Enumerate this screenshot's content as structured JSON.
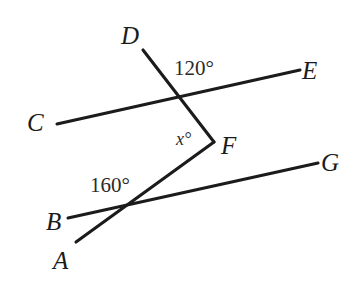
{
  "figure": {
    "type": "geometry-diagram",
    "background_color": "#ffffff",
    "stroke_color": "#1b1b1b",
    "text_color": "#1b1b1b",
    "width": 364,
    "height": 289
  },
  "points": [
    {
      "id": "A",
      "label": "A",
      "x": 53,
      "y": 248
    },
    {
      "id": "B",
      "label": "B",
      "x": 46,
      "y": 209
    },
    {
      "id": "C",
      "label": "C",
      "x": 27,
      "y": 110
    },
    {
      "id": "D",
      "label": "D",
      "x": 121,
      "y": 23
    },
    {
      "id": "E",
      "label": "E",
      "x": 302,
      "y": 58
    },
    {
      "id": "F",
      "label": "F",
      "x": 221,
      "y": 133
    },
    {
      "id": "G",
      "label": "G",
      "x": 321,
      "y": 150
    }
  ],
  "angles": [
    {
      "id": "angle-120",
      "label": "120°",
      "x": 174,
      "y": 58,
      "value": 120,
      "italic": false
    },
    {
      "id": "angle-x",
      "label": "x°",
      "x": 176,
      "y": 130,
      "value": null,
      "italic": true
    },
    {
      "id": "angle-160",
      "label": "160°",
      "x": 90,
      "y": 175,
      "value": 160,
      "italic": false
    }
  ],
  "segments": [
    {
      "id": "line-CE",
      "from": "C",
      "to": "E",
      "x1": 57,
      "y1": 124,
      "x2": 300,
      "y2": 70
    },
    {
      "id": "line-BG",
      "from": "B",
      "to": "G",
      "x1": 68,
      "y1": 218,
      "x2": 318,
      "y2": 163
    },
    {
      "id": "ray-DF",
      "from": "D",
      "to": "F",
      "x1": 143,
      "y1": 50,
      "x2": 214,
      "y2": 142
    },
    {
      "id": "ray-FA",
      "from": "F",
      "to": "A",
      "x1": 214,
      "y1": 142,
      "x2": 76,
      "y2": 242
    }
  ],
  "intersections": [
    {
      "id": "upper-intersection",
      "x": 183,
      "y": 97
    },
    {
      "id": "lower-intersection",
      "x": 128,
      "y": 208
    }
  ]
}
